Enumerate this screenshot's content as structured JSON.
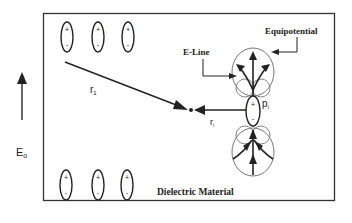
{
  "diagram": {
    "labels": {
      "equipotential": "Equipotential",
      "e_line": "E-Line",
      "material": "Dielectric Material",
      "field": "E",
      "field_sub": "o",
      "r1": "r",
      "r1_sub": "1",
      "ri": "r",
      "ri_sub": "i",
      "pi": "p",
      "pi_sub": "i"
    },
    "dipoles": {
      "plus": "+",
      "minus": "-",
      "top_row_count": 3,
      "bottom_row_count": 3
    },
    "colors": {
      "stroke": "#222222",
      "equipotential": "#777777",
      "background": "#ffffff"
    }
  }
}
